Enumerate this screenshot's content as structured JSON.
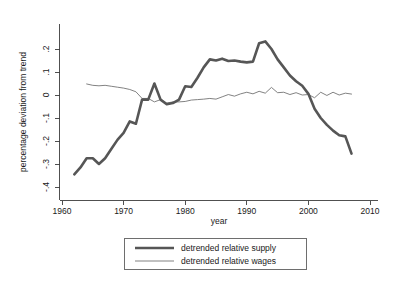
{
  "chart_data": {
    "type": "line",
    "title": "",
    "xlabel": "year",
    "ylabel": "percentage deviation from trend",
    "xlim": [
      1960,
      2010
    ],
    "ylim": [
      -0.4,
      0.25
    ],
    "grid": false,
    "legend_position": "below-center",
    "x_ticks": [
      "1960",
      "1970",
      "1980",
      "1990",
      "2000",
      "2010"
    ],
    "x_tick_values": [
      1960,
      1970,
      1980,
      1990,
      2000,
      2010
    ],
    "y_ticks": [
      ".2",
      ".1",
      "0",
      "-.1",
      "-.2",
      "-.3",
      "-.4"
    ],
    "y_tick_values": [
      0.2,
      0.1,
      0,
      -0.1,
      -0.2,
      -0.3,
      -0.4
    ],
    "series": [
      {
        "name": "detrended relative supply",
        "color": "#565656",
        "line_width": "thick",
        "x": [
          1962,
          1963,
          1964,
          1965,
          1966,
          1967,
          1968,
          1969,
          1970,
          1971,
          1972,
          1973,
          1974,
          1975,
          1976,
          1977,
          1978,
          1979,
          1980,
          1981,
          1982,
          1983,
          1984,
          1985,
          1986,
          1987,
          1988,
          1989,
          1990,
          1991,
          1992,
          1993,
          1994,
          1995,
          1996,
          1997,
          1998,
          1999,
          2000,
          2001,
          2002,
          2003,
          2004,
          2005,
          2006,
          2007
        ],
        "values": [
          -0.345,
          -0.315,
          -0.275,
          -0.275,
          -0.3,
          -0.275,
          -0.235,
          -0.195,
          -0.165,
          -0.115,
          -0.125,
          -0.02,
          -0.02,
          0.05,
          -0.02,
          -0.04,
          -0.035,
          -0.02,
          0.038,
          0.035,
          0.075,
          0.12,
          0.155,
          0.15,
          0.158,
          0.148,
          0.15,
          0.145,
          0.142,
          0.145,
          0.225,
          0.233,
          0.2,
          0.155,
          0.12,
          0.085,
          0.06,
          0.04,
          0.005,
          -0.06,
          -0.1,
          -0.13,
          -0.155,
          -0.175,
          -0.18,
          -0.255
        ]
      },
      {
        "name": "detrended relative wages",
        "color": "#6b6b6b",
        "line_width": "thin",
        "x": [
          1964,
          1965,
          1966,
          1967,
          1968,
          1969,
          1970,
          1971,
          1972,
          1973,
          1974,
          1975,
          1976,
          1977,
          1978,
          1979,
          1980,
          1981,
          1982,
          1983,
          1984,
          1985,
          1986,
          1987,
          1988,
          1989,
          1990,
          1991,
          1992,
          1993,
          1994,
          1995,
          1996,
          1997,
          1998,
          1999,
          2000,
          2001,
          2002,
          2003,
          2004,
          2005,
          2006,
          2007
        ],
        "values": [
          0.048,
          0.042,
          0.04,
          0.042,
          0.038,
          0.034,
          0.03,
          0.024,
          0.014,
          -0.015,
          -0.015,
          -0.03,
          -0.02,
          -0.035,
          -0.03,
          -0.03,
          -0.028,
          -0.022,
          -0.02,
          -0.018,
          -0.015,
          -0.018,
          -0.008,
          0.002,
          -0.005,
          0.005,
          0.012,
          0.005,
          0.016,
          0.008,
          0.033,
          0.01,
          0.012,
          0.002,
          0.01,
          0.0,
          0.002,
          -0.012,
          0.012,
          -0.002,
          0.012,
          0.0,
          0.008,
          0.004
        ]
      }
    ],
    "legend": [
      {
        "label": "detrended relative supply",
        "key": "thick-line-key"
      },
      {
        "label": "detrended relative wages",
        "key": "thin-line-key"
      }
    ]
  }
}
